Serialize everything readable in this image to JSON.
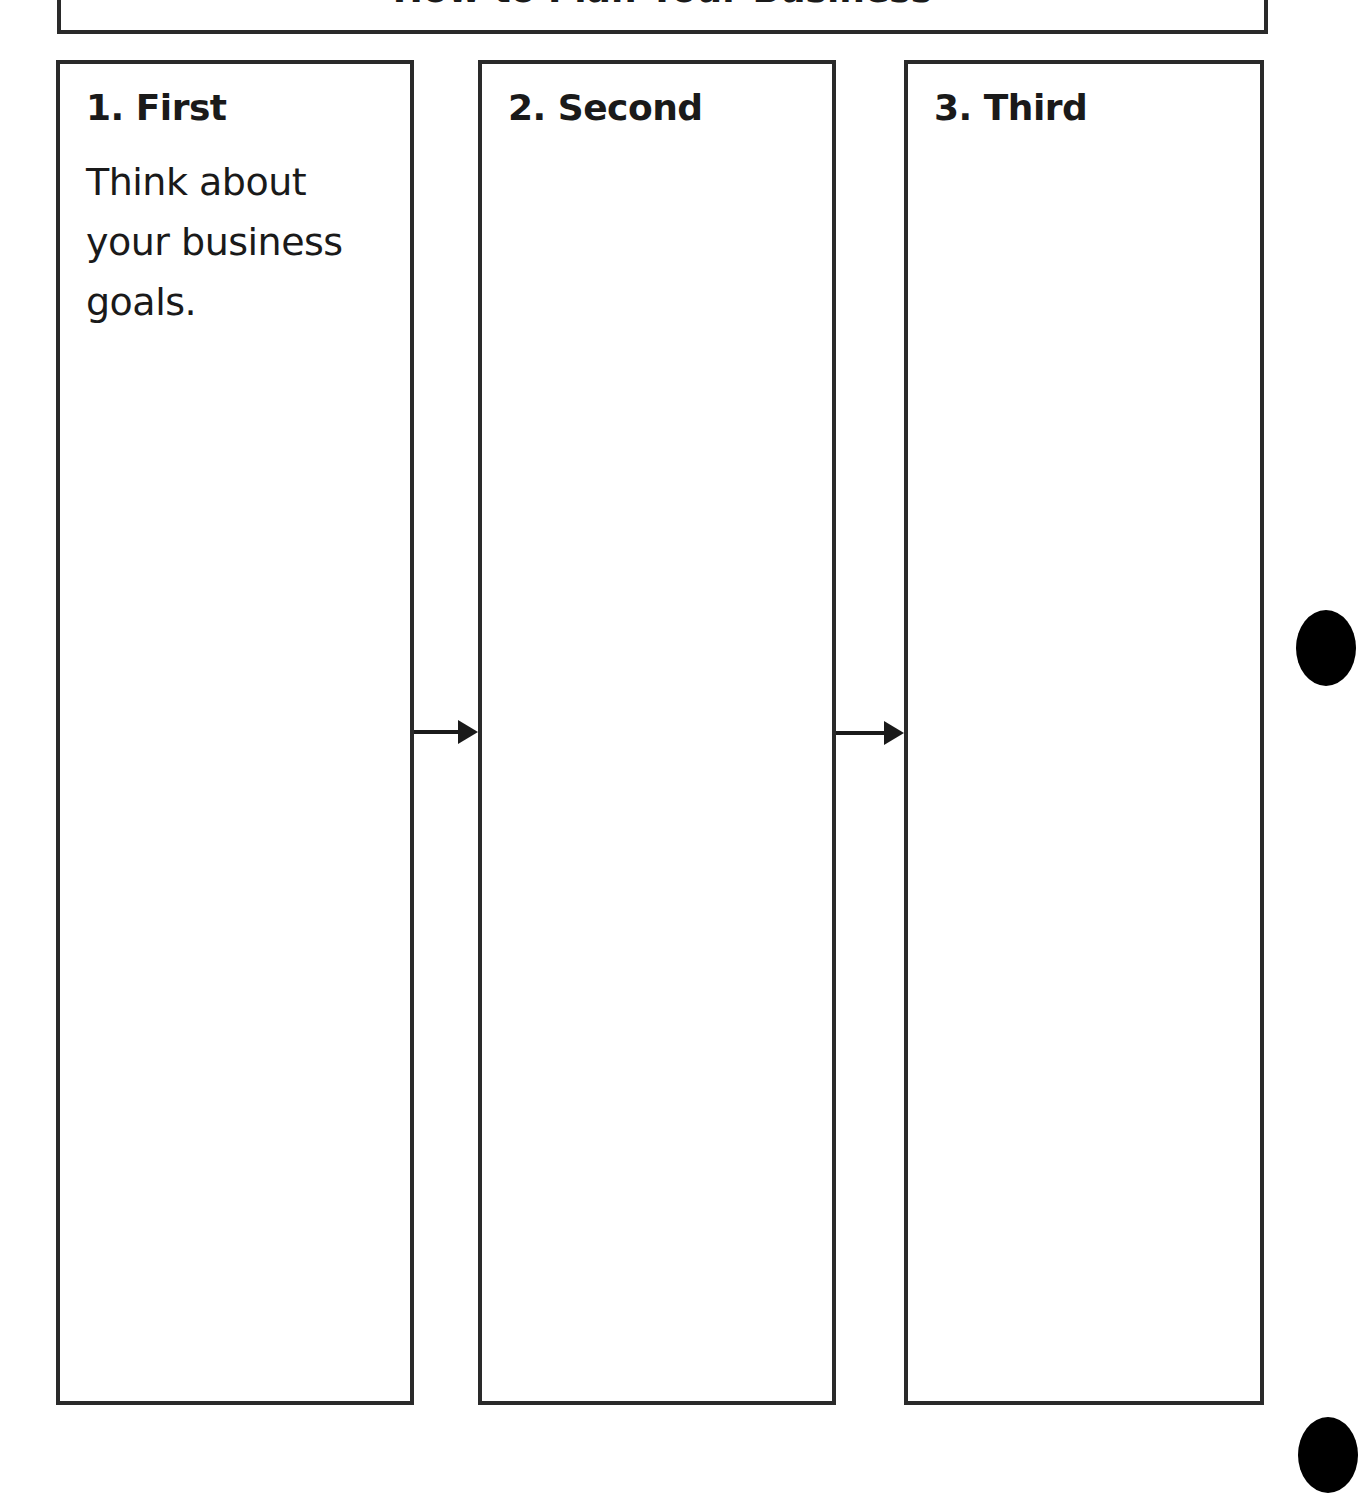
{
  "document": {
    "title": "How to Plan Your Business"
  },
  "steps": [
    {
      "heading": "1. First",
      "body": "Think about your business goals."
    },
    {
      "heading": "2. Second",
      "body": ""
    },
    {
      "heading": "3. Third",
      "body": ""
    }
  ],
  "icons": {
    "arrow_1": "arrow-right-icon",
    "arrow_2": "arrow-right-icon",
    "binder_holes": [
      "binder-hole",
      "binder-hole"
    ]
  },
  "colors": {
    "border": "#2a2a2a",
    "text": "#1a1a1a",
    "background": "#ffffff",
    "binder_hole": "#000000"
  }
}
